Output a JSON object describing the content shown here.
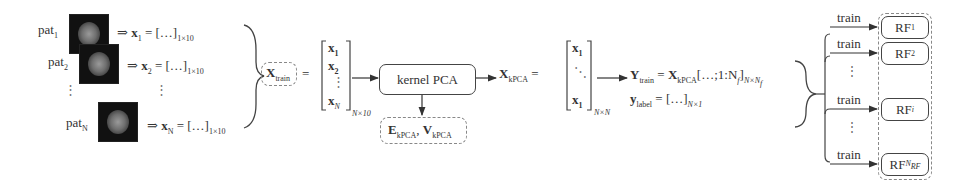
{
  "patients": [
    {
      "label": "pat",
      "sub": "1",
      "vec": "x",
      "vec_sub": "1",
      "rhs": "[…]",
      "dim": "1×10"
    },
    {
      "label": "pat",
      "sub": "2",
      "vec": "x",
      "vec_sub": "2",
      "rhs": "[…]",
      "dim": "1×10"
    },
    {
      "label": "pat",
      "sub": "N",
      "vec": "x",
      "vec_sub": "N",
      "rhs": "[…]",
      "dim": "1×10"
    }
  ],
  "implies": "⇒",
  "vdots": "⋮",
  "xtrain": {
    "symbol": "X",
    "sub": "train",
    "eq": "="
  },
  "matrix1": {
    "rows": [
      "x1",
      "x2",
      "⋮",
      "xN"
    ],
    "dim": "N×10"
  },
  "kpca_box": {
    "label": "kernel PCA"
  },
  "eig_box": {
    "E": "E",
    "E_sub": "kPCA",
    "sep": ",",
    "V": "V",
    "V_sub": "kPCA"
  },
  "xkpca": {
    "symbol": "X",
    "sub": "kPCA",
    "eq": "="
  },
  "matrix2": {
    "rows": [
      "x1",
      "⋱",
      "x1"
    ],
    "dim": "N×N"
  },
  "ytrain": {
    "lhs": "Y",
    "lhs_sub": "train",
    "eq": "=",
    "rhs": "X",
    "rhs_sub": "kPCA",
    "slice": "[…;1:N",
    "slice_sub": "f",
    "close": "]",
    "dim": "N×N",
    "dim_sub": "f"
  },
  "ylabel": {
    "lhs": "y",
    "lhs_sub": "label",
    "eq": "=",
    "rhs": "[…]",
    "dim": "N×1"
  },
  "forest": {
    "edge_label": "train",
    "models": [
      {
        "name": "RF",
        "sub": "1"
      },
      {
        "name": "RF",
        "sub": "2"
      },
      {
        "name": "RF",
        "sub": "i"
      },
      {
        "name": "RF",
        "sub": "N",
        "subsub": "RF"
      }
    ]
  }
}
